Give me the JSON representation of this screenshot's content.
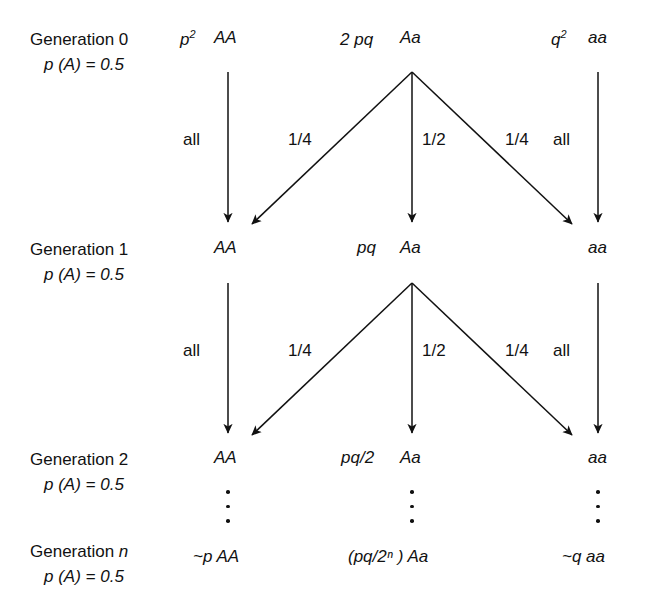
{
  "diagram": {
    "ink_color": "#111111",
    "background": "#ffffff",
    "generations": [
      {
        "name": "Generation 0",
        "allele_freq": "p (A) = 0.5",
        "nodes": [
          {
            "freq": "p",
            "freq_sup": "2",
            "genotype": "AA"
          },
          {
            "freq": "2 pq",
            "freq_sup": "",
            "genotype": "Aa"
          },
          {
            "freq": "q",
            "freq_sup": "2",
            "genotype": "aa"
          }
        ]
      },
      {
        "name": "Generation 1",
        "allele_freq": "p (A) = 0.5",
        "nodes": [
          {
            "freq": "",
            "freq_sup": "",
            "genotype": "AA"
          },
          {
            "freq": "pq",
            "freq_sup": "",
            "genotype": "Aa"
          },
          {
            "freq": "",
            "freq_sup": "",
            "genotype": "aa"
          }
        ]
      },
      {
        "name": "Generation 2",
        "allele_freq": "p (A) = 0.5",
        "nodes": [
          {
            "freq": "",
            "freq_sup": "",
            "genotype": "AA"
          },
          {
            "freq": "pq/2",
            "freq_sup": "",
            "genotype": "Aa"
          },
          {
            "freq": "",
            "freq_sup": "",
            "genotype": "aa"
          }
        ]
      },
      {
        "name": "Generation n",
        "allele_freq": "p (A) = 0.5",
        "nodes": [
          {
            "freq": "",
            "freq_sup": "",
            "genotype": "~p AA"
          },
          {
            "freq": "",
            "freq_sup": "",
            "genotype": "(pq/2ⁿ ) Aa"
          },
          {
            "freq": "",
            "freq_sup": "",
            "genotype": "~q aa"
          }
        ]
      }
    ],
    "transitions": [
      {
        "from": "Generation 0",
        "to": "Generation 1",
        "edges": [
          {
            "label": "all",
            "from_node": "AA",
            "to_node": "AA"
          },
          {
            "label": "1/4",
            "from_node": "Aa",
            "to_node": "AA"
          },
          {
            "label": "1/2",
            "from_node": "Aa",
            "to_node": "Aa"
          },
          {
            "label": "1/4",
            "from_node": "Aa",
            "to_node": "aa"
          },
          {
            "label": "all",
            "from_node": "aa",
            "to_node": "aa"
          }
        ]
      },
      {
        "from": "Generation 1",
        "to": "Generation 2",
        "edges": [
          {
            "label": "all",
            "from_node": "AA",
            "to_node": "AA"
          },
          {
            "label": "1/4",
            "from_node": "Aa",
            "to_node": "AA"
          },
          {
            "label": "1/2",
            "from_node": "Aa",
            "to_node": "Aa"
          },
          {
            "label": "1/4",
            "from_node": "Aa",
            "to_node": "aa"
          },
          {
            "label": "all",
            "from_node": "aa",
            "to_node": "aa"
          }
        ]
      }
    ],
    "ellipsis": {
      "columns": [
        "AA",
        "Aa",
        "aa"
      ],
      "dot_count": 3,
      "meaning": "continues for n generations"
    }
  }
}
